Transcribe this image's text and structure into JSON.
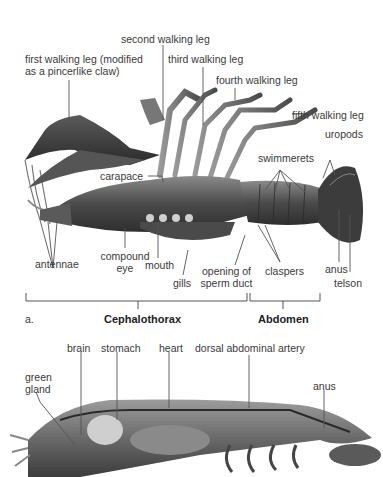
{
  "figure_a": {
    "panel_label": "a.",
    "labels": {
      "second_walking_leg": "second walking leg",
      "first_walking_leg_1": "first walking leg (modified",
      "first_walking_leg_2": "as a pincerlike claw)",
      "third_walking_leg": "third walking leg",
      "fourth_walking_leg": "fourth walking leg",
      "fifth_walking_leg": "fifth walking leg",
      "uropods": "uropods",
      "swimmerets": "swimmerets",
      "carapace": "carapace",
      "antennae": "antennae",
      "compound_eye_1": "compound",
      "compound_eye_2": "eye",
      "mouth": "mouth",
      "gills": "gills",
      "opening_of_sperm_duct_1": "opening of",
      "opening_of_sperm_duct_2": "sperm duct",
      "claspers": "claspers",
      "anus": "anus",
      "telson": "telson"
    },
    "regions": {
      "cephalothorax": "Cephalothorax",
      "abdomen": "Abdomen"
    }
  },
  "figure_b": {
    "labels": {
      "brain": "brain",
      "stomach": "stomach",
      "heart": "heart",
      "dorsal_abdominal_artery": "dorsal abdominal artery",
      "green_gland_1": "green",
      "green_gland_2": "gland",
      "anus": "anus"
    }
  },
  "colors": {
    "body_dark": "#3a3a3a",
    "body_mid": "#6e6e6e",
    "body_light": "#a8a8a8",
    "leader_line": "#555555",
    "text": "#3a3a3a"
  }
}
